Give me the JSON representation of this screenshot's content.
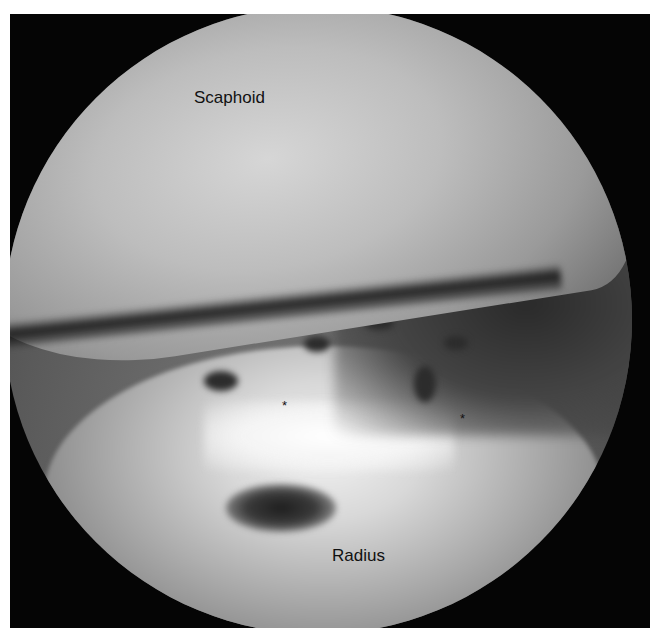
{
  "image": {
    "type": "arthroscopic view",
    "frame_color": "#050505",
    "background_color": "#ffffff"
  },
  "labels": {
    "top_structure": "Scaphoid",
    "bottom_structure": "Radius"
  },
  "markers": [
    {
      "symbol": "*",
      "x": 286,
      "y": 405
    },
    {
      "symbol": "*",
      "x": 464,
      "y": 418
    }
  ]
}
